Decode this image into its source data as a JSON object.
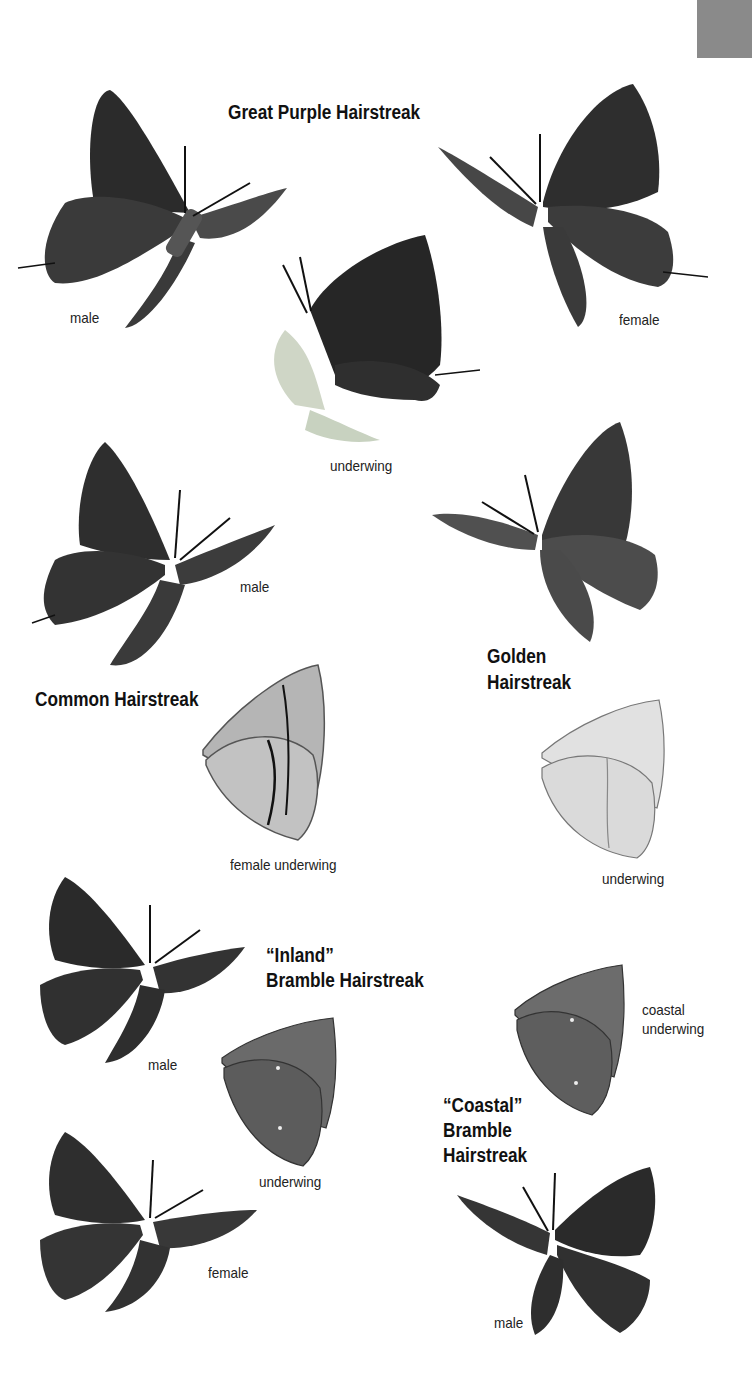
{
  "page": {
    "species": [
      {
        "title": "Great Purple Hairstreak",
        "figures": [
          "male",
          "underwing",
          "female"
        ]
      },
      {
        "title": "Common Hairstreak",
        "figures": [
          "male",
          "female underwing"
        ]
      },
      {
        "title_lines": [
          "Golden",
          "Hairstreak"
        ],
        "figures": [
          "underwing"
        ]
      },
      {
        "title_lines": [
          "“Inland”",
          "Bramble Hairstreak"
        ],
        "figures": [
          "male",
          "underwing",
          "female"
        ]
      },
      {
        "title_lines": [
          "“Coastal”",
          "Bramble",
          "Hairstreak"
        ],
        "figures": [
          "coastal underwing",
          "male"
        ],
        "coastal_underwing_lines": [
          "coastal",
          "underwing"
        ]
      }
    ],
    "colors": {
      "page_tab": "#8a8a8a",
      "dark_wing": "#2e2e2e",
      "mid_wing": "#5a5a5a",
      "light_wing": "#bdbdbd",
      "pale_wing": "#dcdcdc"
    }
  }
}
